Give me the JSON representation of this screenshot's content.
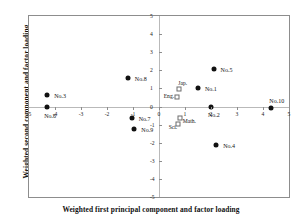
{
  "chart_data": {
    "type": "scatter",
    "title": "",
    "xlabel": "Weighted first principal component and factor loading",
    "ylabel": "Weighted second component and factor loading",
    "xlim": [
      -5,
      5
    ],
    "ylim": [
      -5,
      5
    ],
    "xticks": [
      "-5",
      "-4",
      "-3",
      "-2",
      "-1",
      "0",
      "1",
      "2",
      "3",
      "4",
      "5"
    ],
    "xtickvalues": [
      -5,
      -4,
      -3,
      -2,
      -1,
      0,
      1,
      2,
      3,
      4,
      5
    ],
    "yticks": [
      "5",
      "4",
      "3",
      "2",
      "1",
      "0",
      "-1",
      "-2",
      "-3",
      "-4",
      "-5"
    ],
    "ytickvalues": [
      5,
      4,
      3,
      2,
      1,
      0,
      -1,
      -2,
      -3,
      -4,
      -5
    ],
    "grid": false,
    "legend": "none",
    "series": [
      {
        "name": "samples",
        "marker": "filled-circle",
        "color": "#111111",
        "points": [
          {
            "label": "No.1",
            "x": 1.5,
            "y": 1.0,
            "label_dx": 7,
            "label_dy": 1
          },
          {
            "label": "No.2",
            "x": 2.0,
            "y": -0.05,
            "label_dx": -3,
            "label_dy": 8
          },
          {
            "label": "No.3",
            "x": -4.3,
            "y": 0.62,
            "label_dx": 7,
            "label_dy": 1
          },
          {
            "label": "No.4",
            "x": 2.2,
            "y": -2.1,
            "label_dx": 7,
            "label_dy": 1
          },
          {
            "label": "No.5",
            "x": 2.1,
            "y": 2.08,
            "label_dx": 7,
            "label_dy": 1
          },
          {
            "label": "No.6",
            "x": -4.3,
            "y": -0.02,
            "label_dx": -3,
            "label_dy": 9
          },
          {
            "label": "No.7",
            "x": -1.05,
            "y": -0.62,
            "label_dx": 7,
            "label_dy": 1
          },
          {
            "label": "No.8",
            "x": -1.2,
            "y": 1.58,
            "label_dx": 7,
            "label_dy": 1
          },
          {
            "label": "No.9",
            "x": -0.95,
            "y": -1.22,
            "label_dx": 7,
            "label_dy": 1
          },
          {
            "label": "No.10",
            "x": 4.32,
            "y": -0.1,
            "label_dx": -2,
            "label_dy": -7
          }
        ]
      },
      {
        "name": "subjects",
        "marker": "open-square",
        "color": "#6d6d6d",
        "points": [
          {
            "label": "Eng.",
            "x": 0.68,
            "y": 0.52,
            "label_dx": -13,
            "label_dy": -1
          },
          {
            "label": "Jap.",
            "x": 0.78,
            "y": 0.95,
            "label_dx": -1,
            "label_dy": -6
          },
          {
            "label": "Math.",
            "x": 0.8,
            "y": -0.62,
            "label_dx": 3,
            "label_dy": 3
          },
          {
            "label": "Sci.",
            "x": 0.72,
            "y": -0.95,
            "label_dx": -9,
            "label_dy": 3
          }
        ]
      }
    ]
  }
}
